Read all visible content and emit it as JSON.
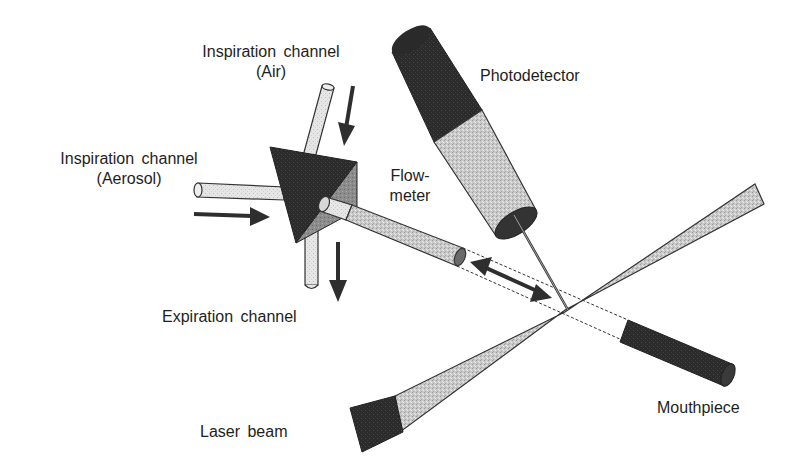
{
  "diagram": {
    "labels": {
      "inspiration_air_line1": "Inspiration channel",
      "inspiration_air_line2": "(Air)",
      "inspiration_aerosol_line1": "Inspiration channel",
      "inspiration_aerosol_line2": "(Aerosol)",
      "expiration": "Expiration channel",
      "flowmeter_line1": "Flow-",
      "flowmeter_line2": "meter",
      "photodetector": "Photodetector",
      "mouthpiece": "Mouthpiece",
      "laser_beam": "Laser beam"
    },
    "colors": {
      "dark": "#2a2a2a",
      "mid": "#6e6e6e",
      "light": "#c8c8c8",
      "pale": "#e4e4e4",
      "outline": "#333333"
    }
  }
}
